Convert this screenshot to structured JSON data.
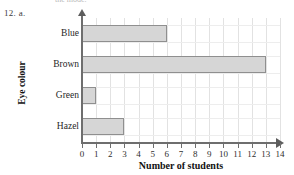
{
  "page": {
    "question_number": "12. a.",
    "clipped_text_above": "the mode."
  },
  "chart_data": {
    "type": "bar",
    "orientation": "horizontal",
    "title": "",
    "categories": [
      "Blue",
      "Brown",
      "Green",
      "Hazel"
    ],
    "values": [
      6,
      13,
      1,
      3
    ],
    "xlabel": "Number of students",
    "ylabel": "Eye colour",
    "xlim": [
      0,
      14
    ],
    "xticks": [
      0,
      1,
      2,
      3,
      4,
      5,
      6,
      7,
      8,
      9,
      10,
      11,
      12,
      13,
      14
    ],
    "xticklabels": [
      "0",
      "1",
      "2",
      "3",
      "4",
      "5",
      "6",
      "7",
      "8",
      "9",
      "10",
      "11",
      "12",
      "13",
      "14"
    ],
    "grid": true,
    "legend": false,
    "bar_fill_color": "#d6d6d6",
    "bar_border_color": "#8f8f8f",
    "axis_color": "#6e6e6e",
    "grid_color": "#e2e2e2"
  }
}
